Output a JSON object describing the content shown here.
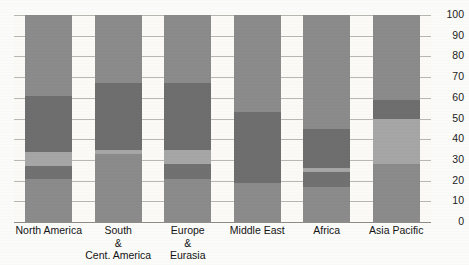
{
  "chart_data": {
    "type": "bar",
    "title": "",
    "subtitle": "",
    "xlabel": "",
    "ylabel": "",
    "ylim": [
      0,
      100
    ],
    "stacked": true,
    "grid": true,
    "legend_position": "none",
    "y_axis_side": "right",
    "y_ticks": [
      100,
      90,
      80,
      70,
      60,
      50,
      40,
      30,
      20,
      10,
      0
    ],
    "categories": [
      "North America",
      "South\n&\nCent. America",
      "Europe\n&\nEurasia",
      "Middle East",
      "Africa",
      "Asia Pacific"
    ],
    "series": [
      {
        "name": "Segment 1",
        "color": "#8b8b8b",
        "values": [
          21,
          33,
          21,
          19,
          17,
          28
        ]
      },
      {
        "name": "Segment 2",
        "color": "#717171",
        "values": [
          6,
          0,
          7,
          0,
          7,
          0
        ]
      },
      {
        "name": "Segment 3",
        "color": "#a6a6a6",
        "values": [
          7,
          2,
          7,
          0,
          2,
          22
        ]
      },
      {
        "name": "Segment 4",
        "color": "#6e6e6e",
        "values": [
          27,
          32,
          32,
          34,
          19,
          9
        ]
      },
      {
        "name": "Segment 5",
        "color": "#8b8b8b",
        "values": [
          39,
          33,
          33,
          47,
          55,
          41
        ]
      }
    ],
    "bar_totals": [
      100,
      100,
      100,
      100,
      100,
      100
    ]
  },
  "axis": {
    "tick_labels": [
      "100",
      "90",
      "80",
      "70",
      "60",
      "50",
      "40",
      "30",
      "20",
      "10",
      "0"
    ]
  },
  "colors": {
    "background": "#fbfaf7",
    "gridline": "#b9b7b0",
    "tone_mid": "#8b8b8b",
    "tone_dark": "#6e6e6e",
    "tone_darker": "#717171",
    "tone_light": "#a6a6a6",
    "text": "#141414"
  }
}
